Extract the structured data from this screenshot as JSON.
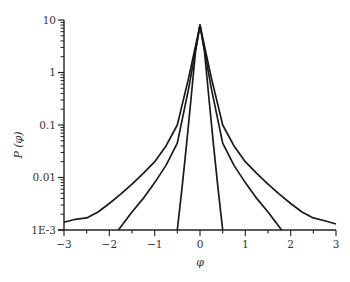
{
  "chart_data": {
    "type": "line",
    "title": "",
    "xlabel": "φ",
    "ylabel": "P (φ)",
    "xlim": [
      -3,
      3
    ],
    "ylim": [
      0.001,
      10
    ],
    "yscale": "log",
    "grid": false,
    "legend": null,
    "x_ticks": [
      "−3",
      "−2",
      "−1",
      "0",
      "1",
      "2",
      "3"
    ],
    "y_ticks": [
      "1E-3",
      "0.01",
      "0.1",
      "1",
      "10"
    ],
    "series": [
      {
        "name": "wide tails",
        "x": [
          -3.0,
          -2.75,
          -2.5,
          -2.25,
          -2.0,
          -1.75,
          -1.5,
          -1.25,
          -1.0,
          -0.75,
          -0.5,
          -0.25,
          0.0,
          0.25,
          0.5,
          0.75,
          1.0,
          1.25,
          1.5,
          1.75,
          2.0,
          2.25,
          2.5,
          2.75,
          3.0
        ],
        "y": [
          0.0014,
          0.0016,
          0.0017,
          0.0022,
          0.0032,
          0.0048,
          0.0075,
          0.012,
          0.02,
          0.04,
          0.1,
          0.8,
          8.0,
          0.8,
          0.1,
          0.04,
          0.02,
          0.012,
          0.0075,
          0.0048,
          0.0032,
          0.0022,
          0.0017,
          0.0015,
          0.0013
        ]
      },
      {
        "name": "medium tails",
        "x": [
          -1.8,
          -1.5,
          -1.25,
          -1.0,
          -0.75,
          -0.5,
          -0.25,
          0.0,
          0.25,
          0.5,
          0.75,
          1.0,
          1.25,
          1.5,
          1.8
        ],
        "y": [
          0.001,
          0.0022,
          0.004,
          0.008,
          0.017,
          0.045,
          0.5,
          8.0,
          0.5,
          0.045,
          0.017,
          0.008,
          0.004,
          0.0022,
          0.001
        ]
      },
      {
        "name": "narrow",
        "x": [
          -0.5,
          -0.4,
          -0.3,
          -0.2,
          -0.1,
          0.0,
          0.1,
          0.2,
          0.3,
          0.4,
          0.5
        ],
        "y": [
          0.001,
          0.006,
          0.04,
          0.3,
          2.5,
          8.0,
          2.5,
          0.3,
          0.04,
          0.006,
          0.001
        ]
      }
    ]
  }
}
